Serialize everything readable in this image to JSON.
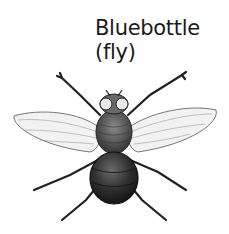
{
  "caption": {
    "line1": "Bluebottle",
    "line2": "(fly)"
  },
  "illustration": {
    "subject": "bluebottle fly, dorsal view, engraved line drawing",
    "colors": {
      "ink": "#1a1a1a",
      "body_dark": "#2a2a2a",
      "wing_fill": "#f2f2f2",
      "background": "#ffffff"
    }
  }
}
